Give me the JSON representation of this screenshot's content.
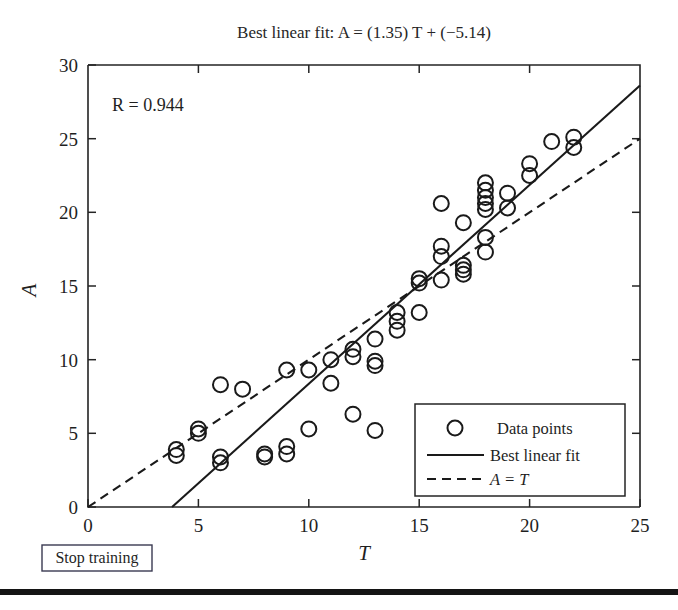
{
  "figure": {
    "title": "Best linear fit: A = (1.35) T + (−5.14)",
    "annotation": "R = 0.944"
  },
  "controls": {
    "stop_training_label": "Stop training"
  },
  "legend": {
    "items": [
      {
        "label": "Data points",
        "marker": "circle-marker-icon"
      },
      {
        "label": "Best linear fit",
        "marker": "solid-line-icon"
      },
      {
        "label": "A = T",
        "marker": "dashed-line-icon"
      }
    ]
  },
  "chart_data": {
    "type": "scatter",
    "title": "Best linear fit: A = (1.35) T + (−5.14)",
    "xlabel": "T",
    "ylabel": "A",
    "xlim": [
      0,
      25
    ],
    "ylim": [
      0,
      30
    ],
    "xticks": [
      0,
      5,
      10,
      15,
      20,
      25
    ],
    "yticks": [
      0,
      5,
      10,
      15,
      20,
      25,
      30
    ],
    "grid": false,
    "legend_position": "lower right",
    "annotations": [
      {
        "text": "R = 0.944",
        "x": 1.2,
        "y": 27.2
      }
    ],
    "fit": {
      "name": "Best linear fit",
      "slope": 1.35,
      "intercept": -5.14,
      "style": "solid",
      "equation": "A = (1.35) T + (−5.14)"
    },
    "identity": {
      "name": "A = T",
      "slope": 1.0,
      "intercept": 0.0,
      "style": "dashed"
    },
    "correlation_R": 0.944,
    "series": [
      {
        "name": "Data points",
        "marker": "circle",
        "points": [
          [
            4.0,
            3.5
          ],
          [
            4.0,
            3.9
          ],
          [
            5.0,
            5.3
          ],
          [
            5.0,
            5.0
          ],
          [
            6.0,
            3.0
          ],
          [
            6.0,
            3.4
          ],
          [
            6.0,
            8.3
          ],
          [
            7.0,
            8.0
          ],
          [
            8.0,
            3.4
          ],
          [
            8.0,
            3.6
          ],
          [
            9.0,
            9.3
          ],
          [
            9.0,
            4.1
          ],
          [
            9.0,
            3.6
          ],
          [
            10.0,
            9.3
          ],
          [
            10.0,
            5.3
          ],
          [
            11.0,
            8.4
          ],
          [
            11.0,
            10.0
          ],
          [
            12.0,
            6.3
          ],
          [
            12.0,
            10.2
          ],
          [
            12.0,
            10.7
          ],
          [
            13.0,
            5.2
          ],
          [
            13.0,
            9.6
          ],
          [
            13.0,
            9.9
          ],
          [
            13.0,
            11.4
          ],
          [
            14.0,
            12.0
          ],
          [
            14.0,
            13.2
          ],
          [
            14.0,
            12.6
          ],
          [
            15.0,
            13.2
          ],
          [
            15.0,
            15.5
          ],
          [
            15.0,
            15.2
          ],
          [
            16.0,
            20.6
          ],
          [
            16.0,
            17.7
          ],
          [
            16.0,
            17.0
          ],
          [
            16.0,
            15.4
          ],
          [
            17.0,
            19.3
          ],
          [
            17.0,
            16.4
          ],
          [
            17.0,
            16.1
          ],
          [
            17.0,
            15.8
          ],
          [
            18.0,
            22.0
          ],
          [
            18.0,
            21.5
          ],
          [
            18.0,
            21.0
          ],
          [
            18.0,
            20.6
          ],
          [
            18.0,
            20.2
          ],
          [
            18.0,
            18.3
          ],
          [
            18.0,
            17.3
          ],
          [
            19.0,
            21.3
          ],
          [
            19.0,
            20.3
          ],
          [
            20.0,
            22.5
          ],
          [
            20.0,
            23.3
          ],
          [
            21.0,
            24.8
          ],
          [
            22.0,
            25.1
          ],
          [
            22.0,
            24.4
          ]
        ]
      }
    ]
  }
}
